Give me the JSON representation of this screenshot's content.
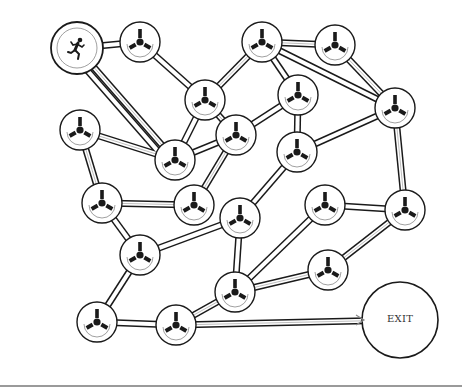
{
  "colors": {
    "stroke": "#1a1a1a",
    "path_inner": "#ffffff",
    "node_fill": "#ffffff",
    "hint": "#888888",
    "rule": "#9a9a9a"
  },
  "start": {
    "id": "start",
    "x": 77,
    "y": 48,
    "r": 26,
    "icon": "runner-icon"
  },
  "exit": {
    "id": "exit",
    "x": 400,
    "y": 320,
    "r": 38,
    "label": "EXIT"
  },
  "nodes": [
    {
      "id": "n1",
      "x": 140,
      "y": 42
    },
    {
      "id": "n2",
      "x": 205,
      "y": 100
    },
    {
      "id": "n3",
      "x": 262,
      "y": 42
    },
    {
      "id": "n4",
      "x": 335,
      "y": 45
    },
    {
      "id": "n5",
      "x": 298,
      "y": 95
    },
    {
      "id": "n6",
      "x": 395,
      "y": 108
    },
    {
      "id": "n7",
      "x": 80,
      "y": 130
    },
    {
      "id": "n8",
      "x": 175,
      "y": 160
    },
    {
      "id": "n9",
      "x": 236,
      "y": 135
    },
    {
      "id": "n10",
      "x": 297,
      "y": 152
    },
    {
      "id": "n11",
      "x": 102,
      "y": 203
    },
    {
      "id": "n12",
      "x": 194,
      "y": 205
    },
    {
      "id": "n13",
      "x": 240,
      "y": 218
    },
    {
      "id": "n14",
      "x": 325,
      "y": 205
    },
    {
      "id": "n15",
      "x": 405,
      "y": 210
    },
    {
      "id": "n16",
      "x": 140,
      "y": 255
    },
    {
      "id": "n17",
      "x": 328,
      "y": 270
    },
    {
      "id": "n18",
      "x": 235,
      "y": 292
    },
    {
      "id": "n19",
      "x": 97,
      "y": 322
    },
    {
      "id": "n20",
      "x": 176,
      "y": 325
    }
  ],
  "node_radius": 20,
  "edges": [
    [
      "start",
      "n1"
    ],
    [
      "start",
      "n8"
    ],
    [
      "start",
      "n8"
    ],
    [
      "n1",
      "n2"
    ],
    [
      "n2",
      "n3"
    ],
    [
      "n2",
      "n8"
    ],
    [
      "n2",
      "n9"
    ],
    [
      "n3",
      "n4"
    ],
    [
      "n3",
      "n6"
    ],
    [
      "n3",
      "n5"
    ],
    [
      "n4",
      "n6"
    ],
    [
      "n5",
      "n9"
    ],
    [
      "n5",
      "n10"
    ],
    [
      "n6",
      "n10"
    ],
    [
      "n6",
      "n15"
    ],
    [
      "n7",
      "n8"
    ],
    [
      "n7",
      "n11"
    ],
    [
      "n8",
      "n9"
    ],
    [
      "n9",
      "n12"
    ],
    [
      "n10",
      "n13"
    ],
    [
      "n11",
      "n12"
    ],
    [
      "n11",
      "n16"
    ],
    [
      "n13",
      "n16"
    ],
    [
      "n13",
      "n18"
    ],
    [
      "n14",
      "n15"
    ],
    [
      "n14",
      "n18"
    ],
    [
      "n15",
      "n17"
    ],
    [
      "n17",
      "n18"
    ],
    [
      "n16",
      "n19"
    ],
    [
      "n19",
      "n20"
    ],
    [
      "n18",
      "n20"
    ],
    [
      "n20",
      "exit"
    ]
  ],
  "hint_path": [
    "start",
    "n8",
    "n7",
    "n11",
    "n12",
    "n9",
    "n2",
    "n3",
    "n4",
    "n6",
    "n15",
    "n17",
    "n18",
    "n20",
    "exit"
  ]
}
